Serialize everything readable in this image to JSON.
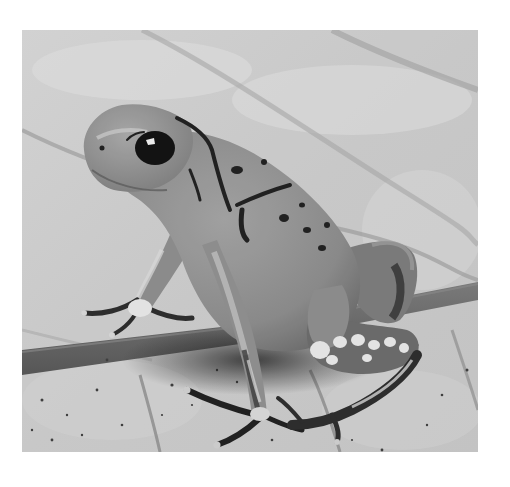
{
  "image": {
    "subject": "poison dart frog",
    "description": "Grayscale photograph of a poison dart frog sitting upright on a leaf surface, with a twig lying diagonally behind it",
    "colors": {
      "border": "#ffffff",
      "background_light": "#d8d8d8",
      "background_mid": "#c2c2c2",
      "vein": "#9a9a9a",
      "twig": "#6e6e6e",
      "frog_body": "#8f8f8f",
      "frog_shadow": "#5a5a5a",
      "frog_highlight": "#b5b5b5",
      "markings": "#1e1e1e",
      "eye": "#0f0f0f",
      "mottled_light": "#e6e6e6"
    }
  }
}
